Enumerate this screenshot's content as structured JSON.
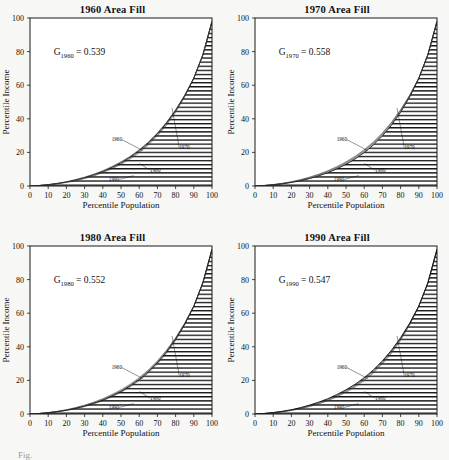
{
  "figure": {
    "background_color": "#f7f7f5",
    "ink_color": "#111111",
    "caption_partial": "Fig."
  },
  "axes_common": {
    "xlabel": "Percentile Population",
    "ylabel": "Percentile Income",
    "xticks": [
      "0",
      "10",
      "20",
      "30",
      "40",
      "50",
      "60",
      "70",
      "80",
      "90",
      "100"
    ],
    "yticks": [
      "0",
      "20",
      "40",
      "60",
      "80",
      "100"
    ],
    "xlim": [
      0,
      100
    ],
    "ylim": [
      0,
      100
    ],
    "grid": false,
    "legend_position": "inline-callouts"
  },
  "curve_labels": [
    "1960",
    "1970",
    "1980",
    "1990"
  ],
  "panels": [
    {
      "title": "1960 Area Fill",
      "gini_symbol": "G",
      "gini_subscript": "1960",
      "gini_equals": "=",
      "gini_value": "0.539",
      "filled_year": "1960"
    },
    {
      "title": "1970 Area Fill",
      "gini_symbol": "G",
      "gini_subscript": "1970",
      "gini_equals": "=",
      "gini_value": "0.558",
      "filled_year": "1970"
    },
    {
      "title": "1980 Area Fill",
      "gini_symbol": "G",
      "gini_subscript": "1980",
      "gini_equals": "=",
      "gini_value": "0.552",
      "filled_year": "1980"
    },
    {
      "title": "1990 Area Fill",
      "gini_symbol": "G",
      "gini_subscript": "1990",
      "gini_equals": "=",
      "gini_value": "0.547",
      "filled_year": "1990"
    }
  ],
  "chart_data": [
    {
      "type": "area",
      "title": "1960 Area Fill",
      "xlabel": "Percentile Population",
      "ylabel": "Percentile Income",
      "xlim": [
        0,
        100
      ],
      "ylim": [
        0,
        100
      ],
      "grid": false,
      "annotations": [
        {
          "text": "G_1960 = 0.539",
          "x": 16,
          "y": 80
        },
        {
          "text": "1960",
          "x": 58,
          "y": 24
        },
        {
          "text": "1970",
          "x": 79,
          "y": 21
        },
        {
          "text": "1980",
          "x": 66,
          "y": 10
        },
        {
          "text": "1990",
          "x": 57,
          "y": 5
        }
      ],
      "x": [
        0,
        5,
        10,
        15,
        20,
        25,
        30,
        35,
        40,
        45,
        50,
        55,
        60,
        65,
        70,
        75,
        80,
        85,
        90,
        95,
        100
      ],
      "series": [
        {
          "name": "1960",
          "gini": 0.539,
          "filled": true,
          "values": [
            0,
            0.3,
            0.8,
            1.5,
            2.4,
            3.6,
            5.0,
            6.7,
            8.7,
            11.1,
            13.9,
            17.2,
            21.1,
            25.7,
            31.1,
            37.5,
            45.0,
            53.8,
            64.2,
            78.0,
            98.0
          ]
        },
        {
          "name": "1970",
          "gini": 0.558,
          "filled": false,
          "values": [
            0,
            0.25,
            0.7,
            1.3,
            2.1,
            3.1,
            4.4,
            6.0,
            7.9,
            10.2,
            12.9,
            16.1,
            19.9,
            24.4,
            29.8,
            36.2,
            43.9,
            53.0,
            64.0,
            78.4,
            98.0
          ]
        },
        {
          "name": "1980",
          "gini": 0.552,
          "filled": false,
          "values": [
            0,
            0.28,
            0.75,
            1.4,
            2.25,
            3.35,
            4.7,
            6.35,
            8.3,
            10.7,
            13.4,
            16.7,
            20.5,
            25.1,
            30.5,
            36.9,
            44.5,
            53.5,
            64.1,
            78.2,
            98.0
          ]
        },
        {
          "name": "1990",
          "gini": 0.547,
          "filled": false,
          "values": [
            0,
            0.32,
            0.85,
            1.6,
            2.55,
            3.8,
            5.3,
            7.05,
            9.1,
            11.6,
            14.4,
            17.7,
            21.6,
            26.2,
            31.6,
            38.0,
            45.4,
            54.1,
            64.3,
            77.9,
            98.0
          ]
        }
      ]
    },
    {
      "type": "area",
      "title": "1970 Area Fill",
      "xlabel": "Percentile Population",
      "ylabel": "Percentile Income",
      "xlim": [
        0,
        100
      ],
      "ylim": [
        0,
        100
      ],
      "grid": false,
      "annotations": [
        {
          "text": "G_1970 = 0.558",
          "x": 16,
          "y": 80
        },
        {
          "text": "1960",
          "x": 58,
          "y": 24
        },
        {
          "text": "1970",
          "x": 79,
          "y": 21
        },
        {
          "text": "1980",
          "x": 66,
          "y": 10
        },
        {
          "text": "1990",
          "x": 57,
          "y": 5
        }
      ],
      "x": [
        0,
        5,
        10,
        15,
        20,
        25,
        30,
        35,
        40,
        45,
        50,
        55,
        60,
        65,
        70,
        75,
        80,
        85,
        90,
        95,
        100
      ],
      "series": [
        {
          "name": "1960",
          "gini": 0.539,
          "filled": false,
          "values": [
            0,
            0.3,
            0.8,
            1.5,
            2.4,
            3.6,
            5.0,
            6.7,
            8.7,
            11.1,
            13.9,
            17.2,
            21.1,
            25.7,
            31.1,
            37.5,
            45.0,
            53.8,
            64.2,
            78.0,
            98.0
          ]
        },
        {
          "name": "1970",
          "gini": 0.558,
          "filled": true,
          "values": [
            0,
            0.25,
            0.7,
            1.3,
            2.1,
            3.1,
            4.4,
            6.0,
            7.9,
            10.2,
            12.9,
            16.1,
            19.9,
            24.4,
            29.8,
            36.2,
            43.9,
            53.0,
            64.0,
            78.4,
            98.0
          ]
        },
        {
          "name": "1980",
          "gini": 0.552,
          "filled": false,
          "values": [
            0,
            0.28,
            0.75,
            1.4,
            2.25,
            3.35,
            4.7,
            6.35,
            8.3,
            10.7,
            13.4,
            16.7,
            20.5,
            25.1,
            30.5,
            36.9,
            44.5,
            53.5,
            64.1,
            78.2,
            98.0
          ]
        },
        {
          "name": "1990",
          "gini": 0.547,
          "filled": false,
          "values": [
            0,
            0.32,
            0.85,
            1.6,
            2.55,
            3.8,
            5.3,
            7.05,
            9.1,
            11.6,
            14.4,
            17.7,
            21.6,
            26.2,
            31.6,
            38.0,
            45.4,
            54.1,
            64.3,
            77.9,
            98.0
          ]
        }
      ]
    },
    {
      "type": "area",
      "title": "1980 Area Fill",
      "xlabel": "Percentile Population",
      "ylabel": "Percentile Income",
      "xlim": [
        0,
        100
      ],
      "ylim": [
        0,
        100
      ],
      "grid": false,
      "annotations": [
        {
          "text": "G_1980 = 0.552",
          "x": 16,
          "y": 80
        },
        {
          "text": "1960",
          "x": 58,
          "y": 24
        },
        {
          "text": "1970",
          "x": 79,
          "y": 21
        },
        {
          "text": "1980",
          "x": 66,
          "y": 10
        },
        {
          "text": "1990",
          "x": 57,
          "y": 5
        }
      ],
      "x": [
        0,
        5,
        10,
        15,
        20,
        25,
        30,
        35,
        40,
        45,
        50,
        55,
        60,
        65,
        70,
        75,
        80,
        85,
        90,
        95,
        100
      ],
      "series": [
        {
          "name": "1960",
          "gini": 0.539,
          "filled": false,
          "values": [
            0,
            0.3,
            0.8,
            1.5,
            2.4,
            3.6,
            5.0,
            6.7,
            8.7,
            11.1,
            13.9,
            17.2,
            21.1,
            25.7,
            31.1,
            37.5,
            45.0,
            53.8,
            64.2,
            78.0,
            98.0
          ]
        },
        {
          "name": "1970",
          "gini": 0.558,
          "filled": false,
          "values": [
            0,
            0.25,
            0.7,
            1.3,
            2.1,
            3.1,
            4.4,
            6.0,
            7.9,
            10.2,
            12.9,
            16.1,
            19.9,
            24.4,
            29.8,
            36.2,
            43.9,
            53.0,
            64.0,
            78.4,
            98.0
          ]
        },
        {
          "name": "1980",
          "gini": 0.552,
          "filled": true,
          "values": [
            0,
            0.28,
            0.75,
            1.4,
            2.25,
            3.35,
            4.7,
            6.35,
            8.3,
            10.7,
            13.4,
            16.7,
            20.5,
            25.1,
            30.5,
            36.9,
            44.5,
            53.5,
            64.1,
            78.2,
            98.0
          ]
        },
        {
          "name": "1990",
          "gini": 0.547,
          "filled": false,
          "values": [
            0,
            0.32,
            0.85,
            1.6,
            2.55,
            3.8,
            5.3,
            7.05,
            9.1,
            11.6,
            14.4,
            17.7,
            21.6,
            26.2,
            31.6,
            38.0,
            45.4,
            54.1,
            64.3,
            77.9,
            98.0
          ]
        }
      ]
    },
    {
      "type": "area",
      "title": "1990 Area Fill",
      "xlabel": "Percentile Population",
      "ylabel": "Percentile Income",
      "xlim": [
        0,
        100
      ],
      "ylim": [
        0,
        100
      ],
      "grid": false,
      "annotations": [
        {
          "text": "G_1990 = 0.547",
          "x": 16,
          "y": 80
        },
        {
          "text": "1960",
          "x": 58,
          "y": 24
        },
        {
          "text": "1970",
          "x": 79,
          "y": 21
        },
        {
          "text": "1980",
          "x": 66,
          "y": 10
        },
        {
          "text": "1990",
          "x": 57,
          "y": 5
        }
      ],
      "x": [
        0,
        5,
        10,
        15,
        20,
        25,
        30,
        35,
        40,
        45,
        50,
        55,
        60,
        65,
        70,
        75,
        80,
        85,
        90,
        95,
        100
      ],
      "series": [
        {
          "name": "1960",
          "gini": 0.539,
          "filled": false,
          "values": [
            0,
            0.3,
            0.8,
            1.5,
            2.4,
            3.6,
            5.0,
            6.7,
            8.7,
            11.1,
            13.9,
            17.2,
            21.1,
            25.7,
            31.1,
            37.5,
            45.0,
            53.8,
            64.2,
            78.0,
            98.0
          ]
        },
        {
          "name": "1970",
          "gini": 0.558,
          "filled": false,
          "values": [
            0,
            0.25,
            0.7,
            1.3,
            2.1,
            3.1,
            4.4,
            6.0,
            7.9,
            10.2,
            12.9,
            16.1,
            19.9,
            24.4,
            29.8,
            36.2,
            43.9,
            53.0,
            64.0,
            78.4,
            98.0
          ]
        },
        {
          "name": "1980",
          "gini": 0.552,
          "filled": false,
          "values": [
            0,
            0.28,
            0.75,
            1.4,
            2.25,
            3.35,
            4.7,
            6.35,
            8.3,
            10.7,
            13.4,
            16.7,
            20.5,
            25.1,
            30.5,
            36.9,
            44.5,
            53.5,
            64.1,
            78.2,
            98.0
          ]
        },
        {
          "name": "1990",
          "gini": 0.547,
          "filled": true,
          "values": [
            0,
            0.32,
            0.85,
            1.6,
            2.55,
            3.8,
            5.3,
            7.05,
            9.1,
            11.6,
            14.4,
            17.7,
            21.6,
            26.2,
            31.6,
            38.0,
            45.4,
            54.1,
            64.3,
            77.9,
            98.0
          ]
        }
      ]
    }
  ]
}
